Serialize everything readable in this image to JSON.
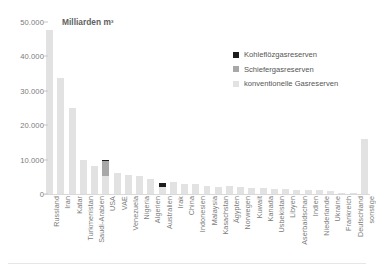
{
  "chart_data": {
    "type": "bar",
    "stacked": true,
    "title": "",
    "axis_unit_label": "Milliarden m³",
    "xlabel": "",
    "ylabel": "Milliarden m³",
    "ylim": [
      0,
      50000
    ],
    "yticks": [
      0,
      10000,
      20000,
      30000,
      40000,
      50000
    ],
    "ytick_labels": [
      "0",
      "10.000",
      "20.000",
      "30.000",
      "40.000",
      "50.000"
    ],
    "grid": false,
    "legend_position": "top-right",
    "categories": [
      "Russland",
      "Iran",
      "Katar",
      "Turkmenistan",
      "Saudi-Arabien",
      "USA",
      "VAE",
      "Venezuela",
      "Nigeria",
      "Algerien",
      "Australien",
      "Irak",
      "China",
      "Indonesien",
      "Malaysia",
      "Kasachstan",
      "Ägypten",
      "Norwegen",
      "Kuwait",
      "Kanada",
      "Usbekistan",
      "Libyen",
      "Aserbaidschan",
      "Indien",
      "Niederlande",
      "Ukraine",
      "Frankreich",
      "Deutschland",
      "sonstige"
    ],
    "series": [
      {
        "name": "konventionelle Gasreserven",
        "color": "#e2e2e2",
        "values": [
          47800,
          33800,
          25100,
          9800,
          8200,
          5200,
          6100,
          5500,
          5100,
          4500,
          2100,
          3600,
          2800,
          2900,
          2400,
          1900,
          2200,
          2000,
          1800,
          1700,
          1600,
          1500,
          1300,
          1200,
          1100,
          900,
          300,
          150,
          16100
        ]
      },
      {
        "name": "Schiefergasreserven",
        "color": "#a8a8a8",
        "values": [
          0,
          0,
          0,
          0,
          0,
          4300,
          0,
          0,
          0,
          0,
          0,
          0,
          0,
          0,
          0,
          0,
          0,
          0,
          0,
          0,
          0,
          0,
          0,
          0,
          0,
          0,
          0,
          0,
          0
        ]
      },
      {
        "name": "Kohleflözgasreserven",
        "color": "#1c1c1c",
        "values": [
          0,
          0,
          0,
          0,
          0,
          400,
          0,
          0,
          0,
          0,
          1000,
          0,
          0,
          0,
          0,
          0,
          0,
          0,
          0,
          0,
          0,
          0,
          0,
          0,
          0,
          0,
          0,
          0,
          0
        ]
      }
    ]
  },
  "legend": {
    "items": [
      {
        "label": "Kohleflözgasreserven",
        "color": "#1c1c1c"
      },
      {
        "label": "Schiefergasreserven",
        "color": "#a8a8a8"
      },
      {
        "label": "konventionelle Gasreserven",
        "color": "#e2e2e2"
      }
    ]
  },
  "colors": {
    "background": "#ffffff",
    "text": "#7a7a7a",
    "axis": "#d9d9d9"
  }
}
